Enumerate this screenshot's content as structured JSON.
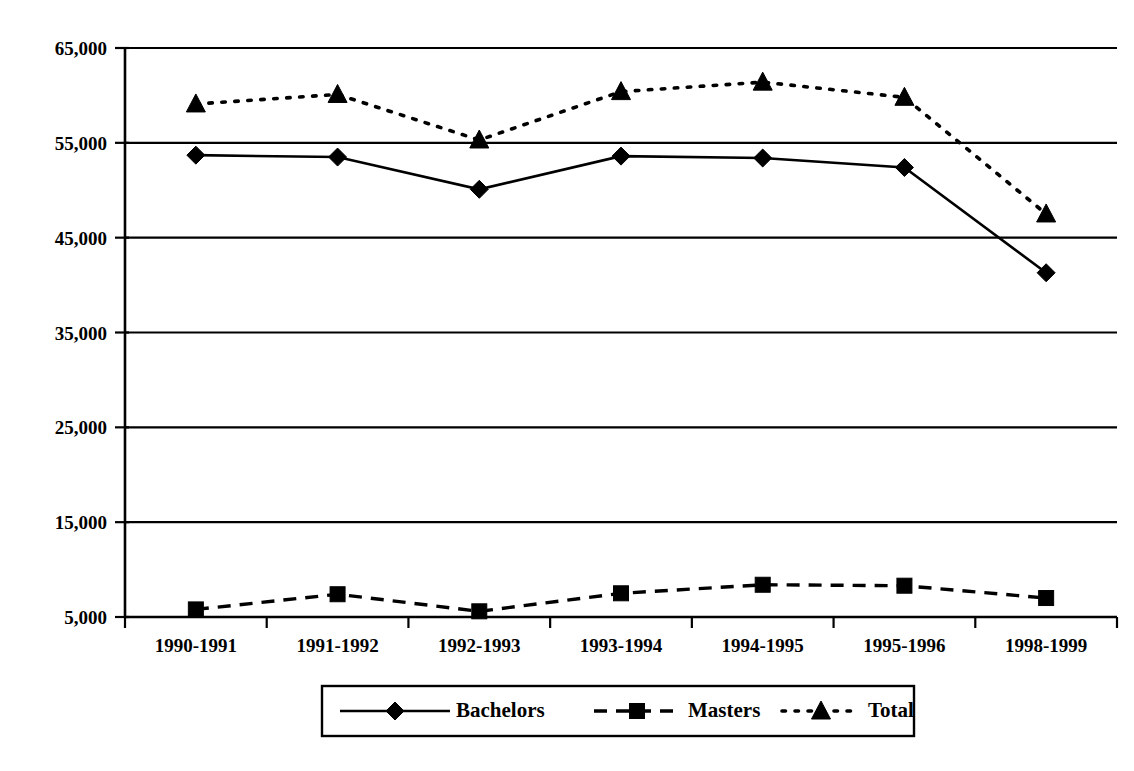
{
  "chart_data": {
    "type": "line",
    "title": "",
    "subtitle": "",
    "xlabel": "",
    "ylabel": "",
    "categories": [
      "1990-1991",
      "1991-1992",
      "1992-1993",
      "1993-1994",
      "1994-1995",
      "1995-1996",
      "1998-1999"
    ],
    "ylim": [
      5000,
      65000
    ],
    "yticks": [
      5000,
      15000,
      25000,
      35000,
      45000,
      55000,
      65000
    ],
    "ytick_labels": [
      "5,000",
      "15,000",
      "25,000",
      "35,000",
      "45,000",
      "55,000",
      "65,000"
    ],
    "grid": "horizontal",
    "legend_position": "bottom",
    "series": [
      {
        "name": "Bachelors",
        "marker": "diamond",
        "line_style": "solid",
        "color": "#000000",
        "values": [
          53700,
          53500,
          50100,
          53600,
          53400,
          52400,
          41300
        ]
      },
      {
        "name": "Masters",
        "marker": "square",
        "line_style": "dashed",
        "color": "#000000",
        "values": [
          5800,
          7400,
          5600,
          7500,
          8400,
          8300,
          7000
        ]
      },
      {
        "name": "Total",
        "marker": "triangle",
        "line_style": "dotted",
        "color": "#000000",
        "values": [
          59100,
          60100,
          55300,
          60400,
          61400,
          59800,
          47500
        ]
      }
    ]
  },
  "legend": {
    "entries": [
      {
        "label": "Bachelors"
      },
      {
        "label": "Masters"
      },
      {
        "label": "Total"
      }
    ]
  },
  "colors": {
    "ink": "#000000",
    "paper": "#ffffff"
  }
}
